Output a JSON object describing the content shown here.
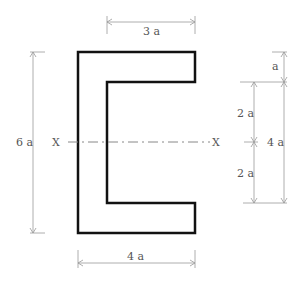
{
  "diagram": {
    "labels": {
      "top_width": "3 a",
      "bottom_width": "4 a",
      "total_height": "6 a",
      "flange_thickness": "a",
      "upper_half": "2 a",
      "lower_half": "2 a",
      "web_height": "4 a",
      "axis_left": "X",
      "axis_right": "X"
    },
    "colors": {
      "outline": "#111111",
      "dimension": "#999999",
      "text": "#555555"
    }
  }
}
